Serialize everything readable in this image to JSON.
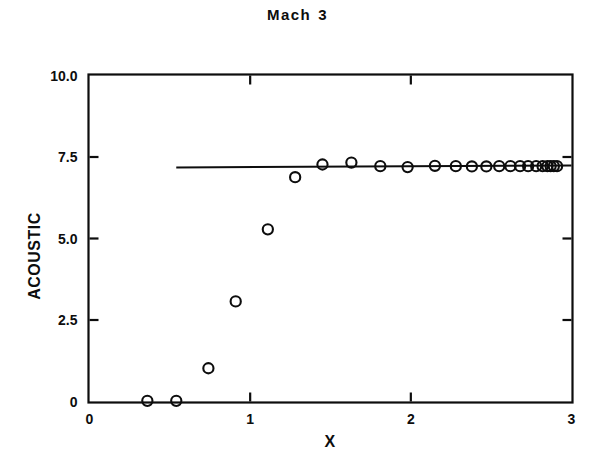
{
  "figure": {
    "title_word_1": "Mach",
    "title_word_2": "3",
    "background_color": "#ffffff",
    "ink_color": "#0d0d0d"
  },
  "chart_data": {
    "type": "scatter",
    "xlabel": "X",
    "ylabel": "ACOUSTIC",
    "xlim": [
      0,
      3
    ],
    "ylim": [
      0,
      10
    ],
    "xticks": [
      0,
      1,
      2,
      3
    ],
    "xtick_labels": [
      "0",
      "1",
      "2",
      "3"
    ],
    "yticks": [
      0,
      2.5,
      5.0,
      7.5,
      10.0
    ],
    "ytick_labels": [
      "0",
      "2.5",
      "5.0",
      "7.5",
      "10.0"
    ],
    "grid": false,
    "legend": "none",
    "marker": "open-circle",
    "series": [
      {
        "name": "acoustic",
        "type": "scatter",
        "marker": "open-circle",
        "points": [
          [
            0.36,
            0.02
          ],
          [
            0.54,
            0.02
          ],
          [
            0.74,
            1.02
          ],
          [
            0.91,
            3.07
          ],
          [
            1.11,
            5.28
          ],
          [
            1.28,
            6.88
          ],
          [
            1.45,
            7.27
          ],
          [
            1.63,
            7.33
          ],
          [
            1.81,
            7.22
          ],
          [
            1.98,
            7.19
          ],
          [
            2.15,
            7.23
          ],
          [
            2.28,
            7.22
          ],
          [
            2.38,
            7.21
          ],
          [
            2.47,
            7.21
          ],
          [
            2.55,
            7.22
          ],
          [
            2.62,
            7.22
          ],
          [
            2.68,
            7.22
          ],
          [
            2.73,
            7.22
          ],
          [
            2.78,
            7.22
          ],
          [
            2.82,
            7.22
          ],
          [
            2.85,
            7.22
          ],
          [
            2.87,
            7.22
          ],
          [
            2.89,
            7.22
          ],
          [
            2.91,
            7.22
          ]
        ]
      },
      {
        "name": "asymptote-line",
        "type": "line",
        "x_start": 0.54,
        "x_end": 3.0,
        "y_start": 7.18,
        "y_end": 7.24
      }
    ]
  },
  "axes": {
    "x_axis_label": "X",
    "y_axis_label": "ACOUSTIC"
  }
}
